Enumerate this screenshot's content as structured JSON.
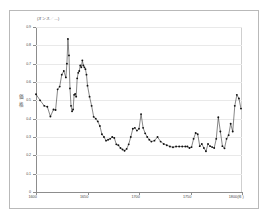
{
  "chart_data": {
    "type": "line",
    "title": "",
    "unit_label": "(オンス／…)",
    "ylabel": "価格",
    "xlabel": "(年)",
    "xlabel_last_tick": "1800",
    "xlim": [
      1600,
      1800
    ],
    "ylim": [
      0,
      0.9
    ],
    "grid": true,
    "legend": "none",
    "markers": true,
    "marker_color": "#111111",
    "line_color": "#222222",
    "yticks": [
      0,
      0.1,
      0.2,
      0.3,
      0.4,
      0.5,
      0.6,
      0.7,
      0.8,
      0.9
    ],
    "ytick_labels": [
      "0",
      "0.1",
      "0.2",
      "0.3",
      "0.4",
      "0.5",
      "0.6",
      "0.7",
      "0.8",
      "0.9"
    ],
    "xticks": [
      1600,
      1650,
      1700,
      1750,
      1800
    ],
    "xtick_labels": [
      "1600",
      "1650",
      "1700",
      "1750",
      "1800(年)"
    ],
    "series": [
      {
        "name": "価格",
        "x": [
          1600,
          1604,
          1608,
          1611,
          1614,
          1617,
          1619,
          1621,
          1623,
          1625,
          1627,
          1629,
          1630,
          1631,
          1632,
          1633,
          1634,
          1635,
          1636,
          1637,
          1638,
          1639,
          1640,
          1641,
          1642,
          1643,
          1644,
          1645,
          1646,
          1647,
          1648,
          1649,
          1650,
          1652,
          1654,
          1656,
          1658,
          1660,
          1662,
          1664,
          1666,
          1668,
          1670,
          1672,
          1674,
          1676,
          1678,
          1680,
          1682,
          1684,
          1686,
          1688,
          1690,
          1692,
          1694,
          1696,
          1698,
          1700,
          1702,
          1704,
          1706,
          1708,
          1710,
          1712,
          1715,
          1718,
          1721,
          1724,
          1727,
          1730,
          1733,
          1736,
          1739,
          1742,
          1745,
          1747,
          1749,
          1751,
          1753,
          1755,
          1757,
          1759,
          1761,
          1763,
          1765,
          1767,
          1769,
          1771,
          1773,
          1775,
          1777,
          1779,
          1781,
          1783,
          1785,
          1787,
          1789,
          1791,
          1793,
          1795,
          1797,
          1799
        ],
        "y": [
          0.533,
          0.5,
          0.47,
          0.465,
          0.412,
          0.45,
          0.447,
          0.56,
          0.575,
          0.64,
          0.66,
          0.625,
          0.7,
          0.835,
          0.745,
          0.565,
          0.47,
          0.44,
          0.45,
          0.53,
          0.535,
          0.52,
          0.62,
          0.65,
          0.66,
          0.69,
          0.68,
          0.718,
          0.69,
          0.68,
          0.67,
          0.64,
          0.58,
          0.52,
          0.47,
          0.41,
          0.4,
          0.385,
          0.36,
          0.315,
          0.3,
          0.28,
          0.285,
          0.29,
          0.3,
          0.295,
          0.26,
          0.255,
          0.24,
          0.232,
          0.225,
          0.235,
          0.26,
          0.3,
          0.345,
          0.35,
          0.335,
          0.345,
          0.425,
          0.35,
          0.32,
          0.3,
          0.285,
          0.275,
          0.28,
          0.3,
          0.275,
          0.262,
          0.255,
          0.248,
          0.244,
          0.248,
          0.248,
          0.248,
          0.248,
          0.248,
          0.24,
          0.245,
          0.29,
          0.322,
          0.315,
          0.25,
          0.262,
          0.24,
          0.222,
          0.262,
          0.25,
          0.245,
          0.24,
          0.29,
          0.408,
          0.33,
          0.25,
          0.238,
          0.29,
          0.31,
          0.372,
          0.33,
          0.47,
          0.53,
          0.51,
          0.455
        ]
      }
    ]
  }
}
